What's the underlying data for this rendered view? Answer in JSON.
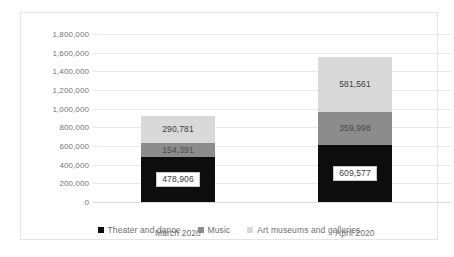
{
  "chart_data": {
    "type": "bar",
    "subtype": "stacked-column",
    "title": "",
    "xlabel": "",
    "ylabel": "",
    "categories": [
      "March 2020",
      "April 2020"
    ],
    "series": [
      {
        "name": "Theater and dance",
        "color": "#0d0d0d",
        "values": [
          478906,
          609577
        ],
        "labels": [
          "478,906",
          "609,577"
        ]
      },
      {
        "name": "Music",
        "color": "#8c8c8c",
        "values": [
          154391,
          359998
        ],
        "labels": [
          "154,391",
          "359,998"
        ]
      },
      {
        "name": "Art museums and galleries",
        "color": "#d9d9d9",
        "values": [
          290781,
          581561
        ],
        "labels": [
          "290,781",
          "581,561"
        ]
      }
    ],
    "totals": [
      924078,
      1551136
    ],
    "ylim": [
      0,
      1800000
    ],
    "ytick_step": 200000,
    "ytick_labels": [
      "1,800,000",
      "1,600,000",
      "1,400,000",
      "1,200,000",
      "1,000,000",
      "800,000",
      "600,000",
      "400,000",
      "200,000",
      "0"
    ],
    "grid": true,
    "legend_position": "bottom"
  },
  "legend": {
    "items": [
      {
        "label": "Theater and dance",
        "color": "#0d0d0d"
      },
      {
        "label": "Music",
        "color": "#8c8c8c"
      },
      {
        "label": "Art museums and galleries",
        "color": "#d9d9d9"
      }
    ]
  }
}
